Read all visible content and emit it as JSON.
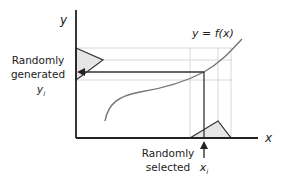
{
  "diagram": {
    "axes": {
      "x_label": "x",
      "y_label": "y"
    },
    "curve": {
      "label": "y = f(x)"
    },
    "left_annotation": {
      "line1": "Randomly",
      "line2": "generated",
      "var": "y",
      "var_sub": "i"
    },
    "bottom_annotation": {
      "line1": "Randomly",
      "line2": "selected",
      "var": "x",
      "var_sub": "i"
    },
    "colors": {
      "axis": "#222222",
      "curve": "#777777",
      "guide": "#d8d8d8",
      "triangle_fill": "#e6e6e6",
      "triangle_stroke": "#333333"
    }
  }
}
